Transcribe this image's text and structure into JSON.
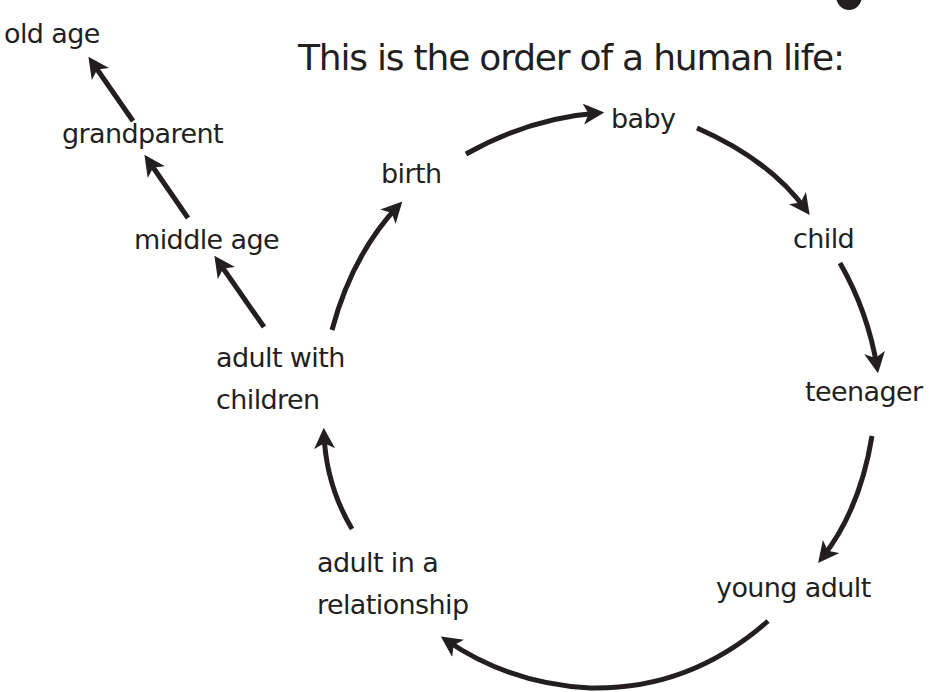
{
  "diagram": {
    "title": "This is the order of a human life:",
    "cycle": [
      {
        "id": "birth",
        "label": "birth"
      },
      {
        "id": "baby",
        "label": "baby"
      },
      {
        "id": "child",
        "label": "child"
      },
      {
        "id": "teenager",
        "label": "teenager"
      },
      {
        "id": "young_adult",
        "label": "young adult"
      },
      {
        "id": "adult_relationship",
        "label_line1": "adult in a",
        "label_line2": "relationship"
      },
      {
        "id": "adult_children",
        "label_line1": "adult with",
        "label_line2": "children"
      }
    ],
    "branch": [
      {
        "id": "middle_age",
        "label": "middle age"
      },
      {
        "id": "grandparent",
        "label": "grandparent"
      },
      {
        "id": "old_age",
        "label": "old age"
      }
    ],
    "edges": [
      {
        "from": "birth",
        "to": "baby"
      },
      {
        "from": "baby",
        "to": "child"
      },
      {
        "from": "child",
        "to": "teenager"
      },
      {
        "from": "teenager",
        "to": "young_adult"
      },
      {
        "from": "young_adult",
        "to": "adult_relationship"
      },
      {
        "from": "adult_relationship",
        "to": "adult_children"
      },
      {
        "from": "adult_children",
        "to": "birth"
      },
      {
        "from": "adult_children",
        "to": "middle_age"
      },
      {
        "from": "middle_age",
        "to": "grandparent"
      },
      {
        "from": "grandparent",
        "to": "old_age"
      }
    ],
    "colors": {
      "text": "#231f20",
      "arrow": "#231f20",
      "background": "#ffffff"
    }
  }
}
